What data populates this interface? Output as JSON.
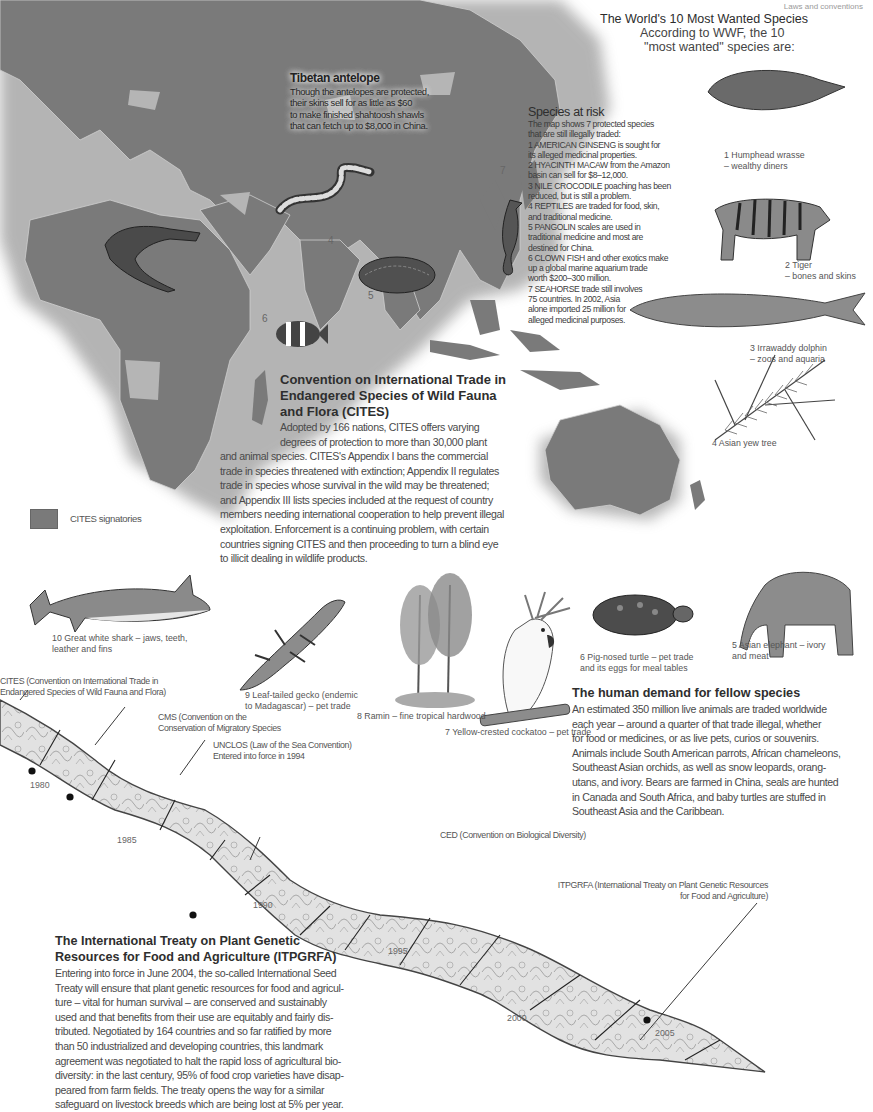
{
  "folio": "Laws and conventions",
  "most_wanted": {
    "title": "The World's 10 Most Wanted Species",
    "intro_line1": "According to WWF, the 10",
    "intro_line2": "\"most wanted\" species are:",
    "species": [
      {
        "num": "1",
        "caption_line1": "1 Humphead wrasse",
        "caption_line2": "–  wealthy diners"
      },
      {
        "num": "2",
        "caption_line1": "2 Tiger",
        "caption_line2": "– bones and skins"
      },
      {
        "num": "3",
        "caption_line1": "3 Irrawaddy dolphin",
        "caption_line2": "–  zoos and aquaria"
      },
      {
        "num": "4",
        "caption_line1": "4 Asian yew tree",
        "caption_line2": ""
      },
      {
        "num": "5",
        "caption_line1": "5 Asian elephant –  ivory",
        "caption_line2": "and meat"
      },
      {
        "num": "6",
        "caption_line1": "6 Pig-nosed turtle – pet trade",
        "caption_line2": "and its eggs for meal tables"
      },
      {
        "num": "7",
        "caption_line1": "7 Yellow-crested cockatoo – pet trade",
        "caption_line2": ""
      },
      {
        "num": "8",
        "caption_line1": "8 Ramin – fine tropical hardwood",
        "caption_line2": ""
      },
      {
        "num": "9",
        "caption_line1": "9 Leaf-tailed gecko (endemic",
        "caption_line2": "to Madagascar) – pet trade"
      },
      {
        "num": "10",
        "caption_line1": "10 Great white shark – jaws, teeth,",
        "caption_line2": "leather and fins"
      }
    ]
  },
  "tibetan": {
    "title": "Tibetan antelope",
    "lines": [
      "Though the antelopes are protected,",
      "their skins sell for as little as $60",
      "to make finished shahtoosh shawls",
      "that can fetch up to $8,000 in China."
    ]
  },
  "species_at_risk": {
    "title": "Species at risk",
    "lines": [
      "The map shows 7 protected species",
      "that are still illegally traded:",
      "1 AMERICAN GINSENG is sought for",
      "its alleged medicinal properties.",
      "2 HYACINTH MACAW from the Amazon",
      "basin can sell for $8–12,000.",
      "3 NILE CROCODILE poaching has been",
      "reduced, but is still a problem.",
      "4 REPTILES are traded for food, skin,",
      "and traditional medicine.",
      "5 PANGOLIN scales are used in",
      "traditional medicine and most are",
      "destined for China.",
      "6 CLOWN FISH and other exotics make",
      "up a global marine aquarium trade",
      "worth $200–300 million.",
      "7 SEAHORSE trade still involves",
      "75 countries. In 2002, Asia",
      "alone imported 25 million for",
      "alleged medicinal purposes."
    ]
  },
  "map": {
    "markers": [
      "3",
      "4",
      "5",
      "6",
      "7"
    ],
    "legend_label": "CITES signatories",
    "signatory_color": "#7a7a7a",
    "non_signatory_color": "#b5b5b5"
  },
  "cites": {
    "title_lines": [
      "Convention on International Trade in",
      "Endangered Species of Wild Fauna",
      "and Flora (CITES)"
    ],
    "lines": [
      "Adopted by 166 nations, CITES offers varying",
      "degrees of protection to more than 30,000 plant",
      "and animal species. CITES's Appendix I bans the commercial",
      "trade in species threatened with extinction; Appendix II regulates",
      "trade in species whose survival in the wild may be threatened;",
      "and Appendix III lists species included at the request of country",
      "members needing international cooperation to help prevent illegal",
      "exploitation. Enforcement is a continuing problem, with certain",
      "countries signing CITES and then proceeding to turn a blind eye",
      "to illicit dealing in wildlife products."
    ]
  },
  "human_demand": {
    "title": "The human demand for fellow species",
    "lines": [
      "An estimated 350 million live animals are traded worldwide",
      "each year – around a quarter of that trade illegal, whether",
      "for food or medicines, or as live pets, curios or souvenirs.",
      "Animals include South American parrots, African chameleons,",
      "Southeast Asian orchids, as well as snow leopards, orang-",
      "utans, and ivory. Bears are farmed in China, seals are hunted",
      "in Canada and South Africa, and baby turtles are stuffed in",
      "Southeast Asia and the Caribbean."
    ]
  },
  "timeline": {
    "years": [
      "1980",
      "1985",
      "1990",
      "1995",
      "2000",
      "2005"
    ],
    "events": [
      {
        "id": "cites",
        "line1": "CITES (Convention on International Trade in",
        "line2": "Endangered Species of Wild Fauna and Flora)"
      },
      {
        "id": "cms",
        "line1": "CMS (Convention on the",
        "line2": "Conservation of Migratory Species"
      },
      {
        "id": "unclos",
        "line1": "UNCLOS (Law of the Sea Convention)",
        "line2": "Entered into force in 1994"
      },
      {
        "id": "ced",
        "line1": "CED (Convention on Biological Diversity)",
        "line2": ""
      },
      {
        "id": "itpgrfa",
        "line1": "ITPGRFA (International Treaty on Plant Genetic Resources",
        "line2": "for Food and Agriculture)"
      }
    ]
  },
  "itpgrfa": {
    "title_lines": [
      "The International Treaty on Plant Genetic",
      "Resources for Food and Agriculture (ITPGRFA)"
    ],
    "lines": [
      "Entering into force in June 2004, the so-called International Seed",
      "Treaty will ensure that plant genetic resources for food and agricul-",
      "ture – vital for human survival – are conserved and sustainably",
      "used and that benefits from their use are equitably and fairly dis-",
      "tributed. Negotiated by 164 countries and so far ratified by more",
      "than 50 industrialized and developing countries, this landmark",
      "agreement was negotiated to halt the rapid loss of agricultural bio-",
      "diversity: in the last century, 95% of food crop varieties have disap-",
      "peared from farm fields. The treaty opens the way for a similar",
      "safeguard on livestock breeds which are being lost at 5% per year."
    ]
  }
}
